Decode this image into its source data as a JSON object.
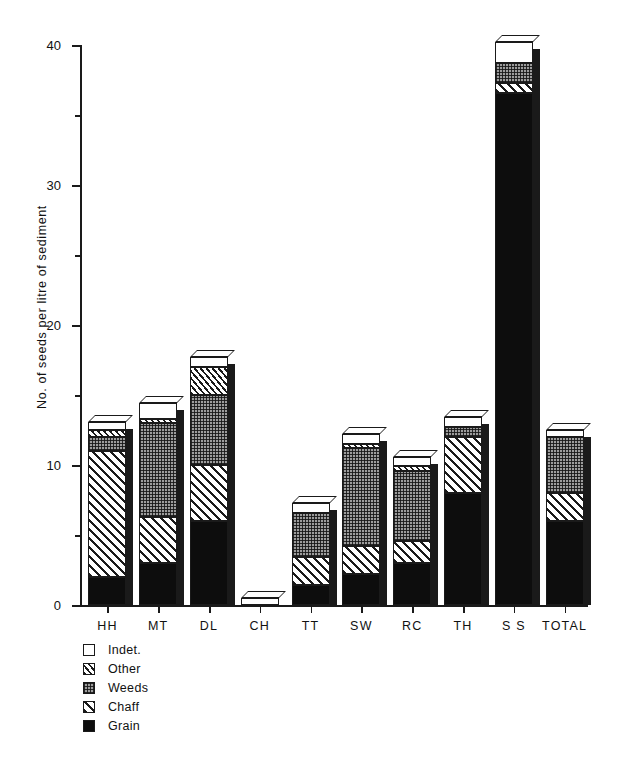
{
  "chart_data": {
    "type": "bar",
    "subtype": "stacked-bar-3d",
    "title": "",
    "xlabel": "",
    "ylabel": "No. of seeds per litre of sediment",
    "ylim": [
      0,
      40
    ],
    "yticks": [
      0,
      10,
      20,
      30,
      40
    ],
    "ytick_labels": [
      "0",
      "10",
      "20",
      "30",
      "40"
    ],
    "yminor_ticks": [
      5,
      15,
      25,
      35
    ],
    "grid": false,
    "legend_position": "below-left",
    "categories": [
      "HH",
      "MT",
      "DL",
      "CH",
      "TT",
      "SW",
      "RC",
      "TH",
      "S S",
      "TOTAL"
    ],
    "series": [
      {
        "name": "Grain",
        "fill": "solid-black",
        "values": [
          2.0,
          3.0,
          6.0,
          0.0,
          1.4,
          2.2,
          3.0,
          8.0,
          36.6,
          6.0
        ]
      },
      {
        "name": "Chaff",
        "fill": "diagonal-hatch",
        "values": [
          9.0,
          3.3,
          4.0,
          0.0,
          2.0,
          2.0,
          1.6,
          4.0,
          0.7,
          2.0
        ]
      },
      {
        "name": "Weeds",
        "fill": "stipple-gray",
        "values": [
          1.0,
          6.7,
          5.0,
          0.0,
          3.2,
          7.0,
          5.0,
          0.7,
          1.4,
          4.0
        ]
      },
      {
        "name": "Other",
        "fill": "narrow-hatch",
        "values": [
          0.5,
          0.3,
          2.0,
          0.0,
          0.0,
          0.3,
          0.3,
          0.0,
          0.0,
          0.0
        ]
      },
      {
        "name": "Indet.",
        "fill": "white",
        "values": [
          0.6,
          1.1,
          0.7,
          0.5,
          0.7,
          0.7,
          0.7,
          0.7,
          1.5,
          0.5
        ]
      }
    ],
    "totals": [
      13.1,
      14.4,
      17.7,
      0.5,
      7.3,
      12.2,
      10.6,
      13.4,
      40.2,
      12.5
    ]
  },
  "legend": {
    "items": [
      {
        "label": "Indet.",
        "fill": "white"
      },
      {
        "label": "Other",
        "fill": "narrow-hatch"
      },
      {
        "label": "Weeds",
        "fill": "stipple-gray"
      },
      {
        "label": "Chaff",
        "fill": "diagonal-hatch"
      },
      {
        "label": "Grain",
        "fill": "solid-black"
      }
    ]
  },
  "axis": {
    "y_title": "No. of seeds per litre of sediment"
  }
}
